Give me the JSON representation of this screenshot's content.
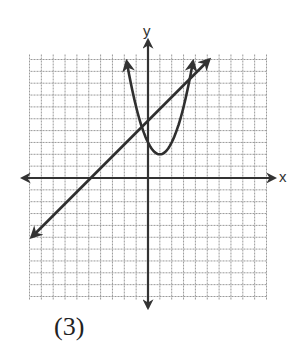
{
  "figure": {
    "caption": "(3)",
    "axis_labels": {
      "x": "x",
      "y": "y"
    }
  },
  "chart_data": {
    "type": "line",
    "title": "",
    "xlabel": "x",
    "ylabel": "y",
    "grid": true,
    "xlim": [
      -10,
      10
    ],
    "ylim": [
      -10,
      10
    ],
    "series": [
      {
        "name": "parabola",
        "equation": "y = (x - 1)^2 + 2",
        "vertex": [
          1,
          2
        ],
        "x": [
          -1.8,
          -1,
          0,
          1,
          2,
          3,
          3.8
        ],
        "values": [
          9.84,
          6,
          3,
          2,
          3,
          6,
          9.84
        ]
      },
      {
        "name": "line",
        "equation": "y = x + 5",
        "x": [
          -10,
          -5,
          0,
          5
        ],
        "values": [
          -5,
          0,
          5,
          10
        ]
      }
    ]
  },
  "colors": {
    "grid": "#9a9a9a",
    "axis": "#333333",
    "curve": "#2f2f2f"
  }
}
